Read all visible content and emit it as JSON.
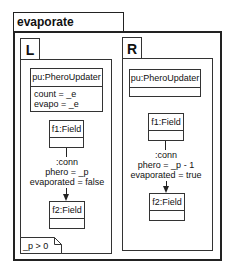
{
  "rule": {
    "name": "evaporate",
    "lhs": {
      "label": "L",
      "objects": {
        "updater": {
          "header": "pu:PheroUpdater",
          "attributes": [
            "count = _e",
            "evapo = _e"
          ]
        },
        "f1": {
          "header": "f1:Field",
          "attributes": []
        },
        "f2": {
          "header": "f2:Field",
          "attributes": []
        }
      },
      "link": {
        "name": ":conn",
        "attributes": [
          "phero = _p",
          "evaporated = false"
        ]
      },
      "condition": "_p > 0"
    },
    "rhs": {
      "label": "R",
      "objects": {
        "updater": {
          "header": "pu:PheroUpdater",
          "attributes": []
        },
        "f1": {
          "header": "f1:Field",
          "attributes": []
        },
        "f2": {
          "header": "f2:Field",
          "attributes": []
        }
      },
      "link": {
        "name": ":conn",
        "attributes": [
          "phero = _p - 1",
          "evaporated = true"
        ]
      }
    }
  }
}
